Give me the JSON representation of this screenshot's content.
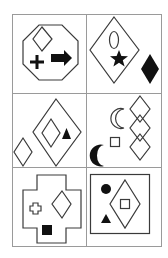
{
  "puzzle": {
    "description": "3x2 grid of geometric figure puzzle panels",
    "rows": 3,
    "columns": 2,
    "colors": {
      "stroke": "#3a3a3a",
      "fill": "#111111",
      "grid": "#9a9a9a",
      "background": "#ffffff"
    },
    "cells": [
      {
        "index": 1,
        "frame": "octagon",
        "elements": [
          "outline-diamond",
          "filled-plus",
          "filled-arrow-right"
        ]
      },
      {
        "index": 2,
        "frame": "diamond",
        "elements": [
          "outline-oval",
          "filled-star",
          "filled-diamond-outside"
        ]
      },
      {
        "index": 3,
        "frame": "diamond",
        "elements": [
          "outline-diamond-inner",
          "filled-triangle",
          "outline-diamond-outside"
        ]
      },
      {
        "index": 4,
        "frame": "none",
        "elements": [
          "three-stacked-outline-diamonds",
          "outline-crescent",
          "outline-square",
          "filled-crescent"
        ]
      },
      {
        "index": 5,
        "frame": "cross",
        "elements": [
          "outline-small-cross",
          "outline-diamond",
          "filled-square"
        ]
      },
      {
        "index": 6,
        "frame": "square",
        "elements": [
          "outline-diamond",
          "outline-square-inner",
          "filled-circle",
          "filled-triangle"
        ]
      }
    ]
  }
}
